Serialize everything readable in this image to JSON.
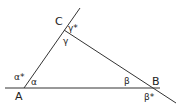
{
  "diagram": {
    "type": "triangle-with-exterior-angles",
    "line_color": "#333333",
    "vertices": {
      "A": {
        "label": "A",
        "x": 24,
        "y": 88
      },
      "B": {
        "label": "B",
        "x": 158,
        "y": 88
      },
      "C": {
        "label": "C",
        "x": 64,
        "y": 30
      }
    },
    "interior_angles": {
      "alpha": "α",
      "beta": "β",
      "gamma": "γ"
    },
    "exterior_angles": {
      "alpha_star": "α*",
      "beta_star": "β*",
      "gamma_star": "γ*"
    }
  }
}
